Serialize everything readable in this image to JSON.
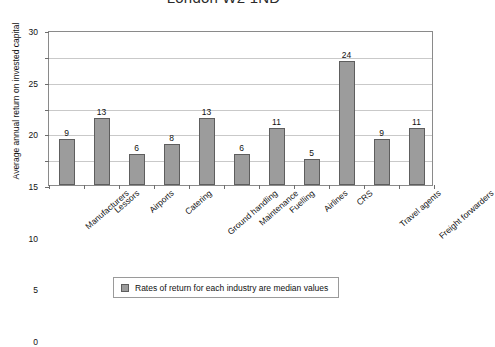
{
  "chart_data": {
    "type": "bar",
    "title": "London W2 1ND",
    "xlabel": "",
    "ylabel": "Average annual return on invested capital",
    "ylim": [
      0,
      30
    ],
    "yticks": [
      0,
      5,
      10,
      15,
      20,
      25,
      30
    ],
    "grid": true,
    "legend_position": "bottom",
    "legend": [
      "Rates of return for each industry are median values"
    ],
    "bar_color": "#9c9c9c",
    "bar_border_color": "#5e5e5e",
    "categories": [
      "Manufacturers",
      "Lessors",
      "Airports",
      "Catering",
      "Ground handling",
      "Maintenance",
      "Fuelling",
      "Airlines",
      "CRS",
      "Travel agents",
      "Freight forwarders"
    ],
    "values": [
      9,
      13,
      6,
      8,
      13,
      6,
      11,
      5,
      24,
      9,
      11
    ],
    "value_labels": [
      "9",
      "13",
      "6",
      "8",
      "13",
      "6",
      "11",
      "5",
      "24",
      "9",
      "11"
    ]
  },
  "legend": {
    "entry_label": "Rates of return for each industry are median values"
  },
  "axes": {
    "y_title": "Average annual return on invested capital",
    "y_tick_labels": [
      "0",
      "5",
      "10",
      "15",
      "20",
      "25",
      "30"
    ]
  },
  "header": {
    "title": "London W2 1ND"
  }
}
